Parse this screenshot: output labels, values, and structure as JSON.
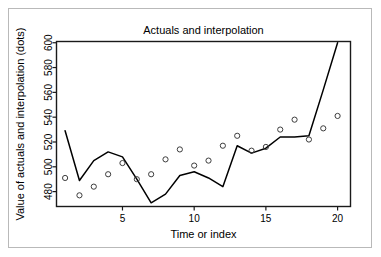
{
  "chart_data": {
    "type": "line",
    "title": "Actuals and interpolation",
    "xlabel": "Time or index",
    "ylabel": "Value of actuals and interpolation (dots)",
    "xlim": [
      0.4,
      20.9
    ],
    "ylim": [
      468,
      601
    ],
    "grid": false,
    "legend": null,
    "xticks": [
      5,
      10,
      15,
      20
    ],
    "yticks": [
      480,
      500,
      520,
      540,
      560,
      580,
      600
    ],
    "x": [
      1,
      2,
      3,
      4,
      5,
      6,
      7,
      8,
      9,
      10,
      11,
      12,
      13,
      14,
      15,
      16,
      17,
      18,
      19,
      20
    ],
    "series": [
      {
        "name": "interpolation",
        "kind": "line",
        "values": [
          529,
          489,
          505,
          512,
          508,
          490,
          471,
          478,
          493,
          496,
          491,
          484,
          517,
          511,
          515,
          524,
          524,
          525,
          562,
          600
        ]
      },
      {
        "name": "actuals",
        "kind": "points",
        "marker": "open-circle",
        "values": [
          491,
          477,
          484,
          494,
          503,
          490,
          494,
          506,
          514,
          501,
          505,
          517,
          525,
          513,
          516,
          530,
          538,
          522,
          531,
          541
        ]
      }
    ]
  },
  "axis": {
    "x_tick_labels": [
      "5",
      "10",
      "15",
      "20"
    ],
    "y_tick_labels": [
      "480",
      "500",
      "520",
      "540",
      "560",
      "580",
      "600"
    ]
  },
  "colors": {
    "line": "#000000",
    "point_stroke": "#3d3d3d",
    "axis": "#1a1a1a",
    "frame": "#b9b9b9",
    "background": "#ffffff"
  }
}
